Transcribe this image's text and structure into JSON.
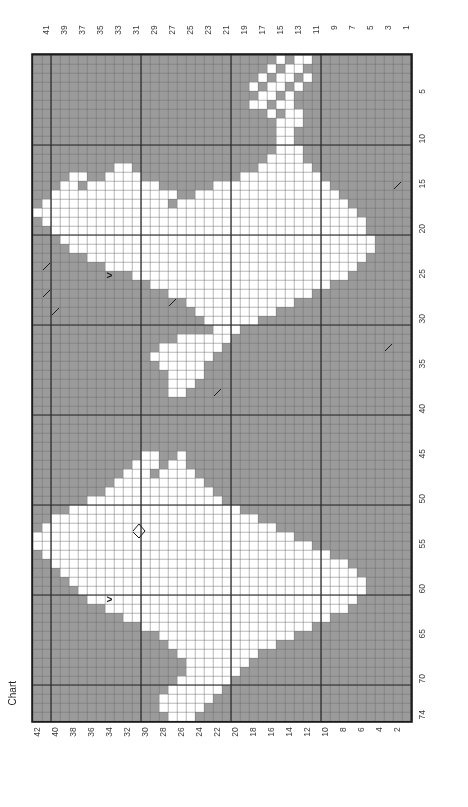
{
  "caption": "Chart",
  "grid": {
    "columns": 42,
    "rows": 74,
    "cell_px": 9,
    "origin_x": 33,
    "origin_y": 55,
    "colors": {
      "background_stitch": "#9b9b9b",
      "foreground_stitch": "#ffffff",
      "minor_gridline": "#6f6f6f",
      "major_gridline": "#2a2a2a",
      "border": "#1b1b1b",
      "label_text": "#3b3b3b",
      "symbol": "#1b1b1b",
      "page": "#ffffff"
    },
    "major_every": 10,
    "column_direction": "right-to-left",
    "row_direction": "top-to-bottom"
  },
  "axes": {
    "top_labels": [
      41,
      39,
      37,
      35,
      33,
      31,
      29,
      27,
      25,
      23,
      21,
      19,
      17,
      15,
      13,
      11,
      9,
      7,
      5,
      3,
      1
    ],
    "bottom_labels": [
      42,
      40,
      38,
      36,
      34,
      32,
      30,
      28,
      26,
      24,
      22,
      20,
      18,
      16,
      14,
      12,
      10,
      8,
      6,
      4,
      2
    ],
    "right_labels": [
      5,
      10,
      15,
      20,
      25,
      30,
      35,
      40,
      45,
      50,
      55,
      60,
      65,
      70,
      74
    ]
  },
  "chart_data": {
    "type": "heatmap",
    "title": "Chart",
    "xlabel": "",
    "ylabel": "",
    "legend": [
      {
        "symbol": "background",
        "color": "#9b9b9b",
        "label": "background stitch"
      },
      {
        "symbol": "foreground",
        "color": "#ffffff",
        "label": "contrast stitch"
      }
    ],
    "white_runs": [
      {
        "row": 1,
        "runs": [
          [
            12,
            13
          ],
          [
            15,
            15
          ]
        ]
      },
      {
        "row": 2,
        "runs": [
          [
            13,
            14
          ],
          [
            16,
            16
          ]
        ]
      },
      {
        "row": 3,
        "runs": [
          [
            12,
            12
          ],
          [
            14,
            15
          ],
          [
            17,
            17
          ]
        ]
      },
      {
        "row": 4,
        "runs": [
          [
            13,
            13
          ],
          [
            15,
            16
          ],
          [
            18,
            18
          ]
        ]
      },
      {
        "row": 5,
        "runs": [
          [
            14,
            14
          ],
          [
            16,
            17
          ]
        ]
      },
      {
        "row": 6,
        "runs": [
          [
            14,
            15
          ],
          [
            17,
            18
          ]
        ]
      },
      {
        "row": 7,
        "runs": [
          [
            13,
            14
          ],
          [
            16,
            16
          ]
        ]
      },
      {
        "row": 8,
        "runs": [
          [
            13,
            15
          ]
        ]
      },
      {
        "row": 9,
        "runs": [
          [
            14,
            15
          ]
        ]
      },
      {
        "row": 10,
        "runs": [
          [
            14,
            15
          ]
        ]
      },
      {
        "row": 11,
        "runs": [
          [
            13,
            15
          ]
        ]
      },
      {
        "row": 12,
        "runs": [
          [
            13,
            16
          ]
        ]
      },
      {
        "row": 13,
        "runs": [
          [
            12,
            17
          ],
          [
            32,
            33
          ]
        ]
      },
      {
        "row": 14,
        "runs": [
          [
            11,
            19
          ],
          [
            31,
            34
          ],
          [
            37,
            38
          ]
        ]
      },
      {
        "row": 15,
        "runs": [
          [
            10,
            22
          ],
          [
            29,
            36
          ],
          [
            38,
            39
          ]
        ]
      },
      {
        "row": 16,
        "runs": [
          [
            9,
            24
          ],
          [
            27,
            40
          ]
        ]
      },
      {
        "row": 17,
        "runs": [
          [
            8,
            26
          ],
          [
            28,
            41
          ]
        ]
      },
      {
        "row": 18,
        "runs": [
          [
            7,
            42
          ]
        ]
      },
      {
        "row": 19,
        "runs": [
          [
            6,
            41
          ]
        ]
      },
      {
        "row": 20,
        "runs": [
          [
            6,
            40
          ]
        ]
      },
      {
        "row": 21,
        "runs": [
          [
            5,
            39
          ]
        ]
      },
      {
        "row": 22,
        "runs": [
          [
            5,
            38
          ]
        ]
      },
      {
        "row": 23,
        "runs": [
          [
            6,
            36
          ]
        ]
      },
      {
        "row": 24,
        "runs": [
          [
            7,
            34
          ]
        ]
      },
      {
        "row": 25,
        "runs": [
          [
            8,
            31
          ]
        ]
      },
      {
        "row": 26,
        "runs": [
          [
            10,
            29
          ]
        ]
      },
      {
        "row": 27,
        "runs": [
          [
            12,
            27
          ]
        ]
      },
      {
        "row": 28,
        "runs": [
          [
            14,
            25
          ]
        ]
      },
      {
        "row": 29,
        "runs": [
          [
            16,
            24
          ]
        ]
      },
      {
        "row": 30,
        "runs": [
          [
            18,
            23
          ]
        ]
      },
      {
        "row": 31,
        "runs": [
          [
            20,
            22
          ]
        ]
      },
      {
        "row": 32,
        "runs": [
          [
            21,
            26
          ]
        ]
      },
      {
        "row": 33,
        "runs": [
          [
            22,
            28
          ]
        ]
      },
      {
        "row": 34,
        "runs": [
          [
            23,
            29
          ]
        ]
      },
      {
        "row": 35,
        "runs": [
          [
            24,
            28
          ]
        ]
      },
      {
        "row": 36,
        "runs": [
          [
            24,
            27
          ]
        ]
      },
      {
        "row": 37,
        "runs": [
          [
            25,
            27
          ]
        ]
      },
      {
        "row": 38,
        "runs": [
          [
            26,
            27
          ]
        ]
      },
      {
        "row": 45,
        "runs": [
          [
            26,
            26
          ],
          [
            29,
            30
          ]
        ]
      },
      {
        "row": 46,
        "runs": [
          [
            26,
            27
          ],
          [
            29,
            31
          ]
        ]
      },
      {
        "row": 47,
        "runs": [
          [
            25,
            28
          ],
          [
            30,
            32
          ]
        ]
      },
      {
        "row": 48,
        "runs": [
          [
            24,
            30
          ],
          [
            31,
            33
          ]
        ]
      },
      {
        "row": 49,
        "runs": [
          [
            23,
            34
          ]
        ]
      },
      {
        "row": 50,
        "runs": [
          [
            22,
            36
          ]
        ]
      },
      {
        "row": 51,
        "runs": [
          [
            20,
            38
          ]
        ]
      },
      {
        "row": 52,
        "runs": [
          [
            18,
            40
          ]
        ]
      },
      {
        "row": 53,
        "runs": [
          [
            16,
            41
          ]
        ]
      },
      {
        "row": 54,
        "runs": [
          [
            14,
            42
          ]
        ]
      },
      {
        "row": 55,
        "runs": [
          [
            12,
            42
          ]
        ]
      },
      {
        "row": 56,
        "runs": [
          [
            10,
            41
          ]
        ]
      },
      {
        "row": 57,
        "runs": [
          [
            8,
            40
          ]
        ]
      },
      {
        "row": 58,
        "runs": [
          [
            7,
            39
          ]
        ]
      },
      {
        "row": 59,
        "runs": [
          [
            6,
            38
          ]
        ]
      },
      {
        "row": 60,
        "runs": [
          [
            6,
            37
          ]
        ]
      },
      {
        "row": 61,
        "runs": [
          [
            7,
            36
          ]
        ]
      },
      {
        "row": 62,
        "runs": [
          [
            8,
            34
          ]
        ]
      },
      {
        "row": 63,
        "runs": [
          [
            10,
            32
          ]
        ]
      },
      {
        "row": 64,
        "runs": [
          [
            12,
            30
          ]
        ]
      },
      {
        "row": 65,
        "runs": [
          [
            14,
            28
          ]
        ]
      },
      {
        "row": 66,
        "runs": [
          [
            16,
            27
          ]
        ]
      },
      {
        "row": 67,
        "runs": [
          [
            18,
            26
          ]
        ]
      },
      {
        "row": 68,
        "runs": [
          [
            19,
            25
          ]
        ]
      },
      {
        "row": 69,
        "runs": [
          [
            20,
            25
          ]
        ]
      },
      {
        "row": 70,
        "runs": [
          [
            21,
            26
          ]
        ]
      },
      {
        "row": 71,
        "runs": [
          [
            22,
            27
          ]
        ]
      },
      {
        "row": 72,
        "runs": [
          [
            23,
            28
          ]
        ]
      },
      {
        "row": 73,
        "runs": [
          [
            24,
            28
          ]
        ]
      },
      {
        "row": 74,
        "runs": [
          [
            25,
            27
          ]
        ]
      }
    ],
    "symbols": [
      {
        "name": "chevron-right",
        "glyph": ">",
        "col": 34,
        "row": 25
      },
      {
        "name": "chevron-right",
        "glyph": ">",
        "col": 34,
        "row": 61
      },
      {
        "name": "diagonal-tick",
        "col": 41,
        "row": 24
      },
      {
        "name": "diagonal-tick",
        "col": 41,
        "row": 27
      },
      {
        "name": "diagonal-tick",
        "col": 40,
        "row": 29
      },
      {
        "name": "diagonal-tick",
        "col": 2,
        "row": 15
      },
      {
        "name": "diagonal-tick",
        "col": 3,
        "row": 33
      },
      {
        "name": "diagonal-tick",
        "col": 22,
        "row": 38
      },
      {
        "name": "diagonal-tick",
        "col": 27,
        "row": 28
      },
      {
        "name": "loop-marker",
        "col": 31,
        "row": 53
      }
    ]
  }
}
